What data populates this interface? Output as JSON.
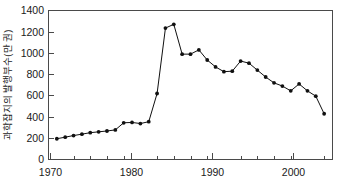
{
  "chart_data": {
    "type": "line",
    "title": "",
    "subtitle": "",
    "xlabel": "",
    "ylabel": "과학잡지의 발행부수(만 권)",
    "xlim": [
      1969,
      2003
    ],
    "ylim": [
      0,
      1400
    ],
    "grid": false,
    "legend": null,
    "x_ticks_major": [
      1970,
      1980,
      1990,
      2000
    ],
    "x_tick_labels": [
      "1970",
      "1980",
      "1990",
      "2000"
    ],
    "x_minor_tick_interval": 2,
    "y_ticks": [
      0,
      200,
      400,
      600,
      800,
      1000,
      1200,
      1400
    ],
    "y_tick_labels": [
      "0",
      "200",
      "400",
      "600",
      "800",
      "1000",
      "1200",
      "1400"
    ],
    "marker": "filled-circle",
    "line_color": "#101010",
    "marker_color": "#101010",
    "axis_color": "#4a4a4a",
    "background_color": "#ffffff",
    "series": [
      {
        "name": "과학잡지의 발행부수",
        "x": [
          1970,
          1971,
          1972,
          1973,
          1974,
          1975,
          1976,
          1977,
          1978,
          1979,
          1980,
          1981,
          1982,
          1983,
          1984,
          1985,
          1986,
          1987,
          1988,
          1989,
          1990,
          1991,
          1992,
          1993,
          1994,
          1995,
          1996,
          1997,
          1998,
          1999,
          2000,
          2001,
          2002
        ],
        "values": [
          195,
          210,
          225,
          238,
          252,
          260,
          268,
          278,
          345,
          348,
          338,
          355,
          620,
          1235,
          1270,
          990,
          990,
          1030,
          935,
          870,
          825,
          830,
          925,
          905,
          840,
          775,
          720,
          690,
          645,
          710,
          645,
          595,
          430
        ]
      }
    ]
  },
  "axes": {
    "y_axis_title": "과학잡지의 발행부수(만 권)"
  }
}
